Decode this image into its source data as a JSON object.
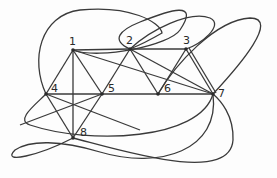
{
  "diagram": {
    "type": "graph",
    "nodes": [
      {
        "id": "1",
        "label": "1",
        "x": 73,
        "y": 50,
        "lx": 69,
        "ly": 44
      },
      {
        "id": "2",
        "label": "2",
        "x": 130,
        "y": 49,
        "lx": 126,
        "ly": 44
      },
      {
        "id": "3",
        "label": "3",
        "x": 186,
        "y": 49,
        "lx": 183,
        "ly": 44
      },
      {
        "id": "4",
        "label": "4",
        "x": 46,
        "y": 94,
        "lx": 52,
        "ly": 92
      },
      {
        "id": "5",
        "label": "5",
        "x": 102,
        "y": 94,
        "lx": 108,
        "ly": 92
      },
      {
        "id": "6",
        "label": "6",
        "x": 158,
        "y": 94,
        "lx": 164,
        "ly": 92
      },
      {
        "id": "7",
        "label": "7",
        "x": 213,
        "y": 94,
        "lx": 218,
        "ly": 97
      },
      {
        "id": "8",
        "label": "8",
        "x": 73,
        "y": 138,
        "lx": 79,
        "ly": 136
      }
    ],
    "edges": [
      [
        "1",
        "2"
      ],
      [
        "2",
        "3"
      ],
      [
        "1",
        "4"
      ],
      [
        "1",
        "5"
      ],
      [
        "1",
        "6"
      ],
      [
        "1",
        "8"
      ],
      [
        "2",
        "5"
      ],
      [
        "2",
        "6"
      ],
      [
        "2",
        "7"
      ],
      [
        "3",
        "6"
      ],
      [
        "3",
        "7"
      ],
      [
        "4",
        "5"
      ],
      [
        "5",
        "6"
      ],
      [
        "6",
        "7"
      ],
      [
        "4",
        "8"
      ],
      [
        "5",
        "8"
      ]
    ]
  }
}
